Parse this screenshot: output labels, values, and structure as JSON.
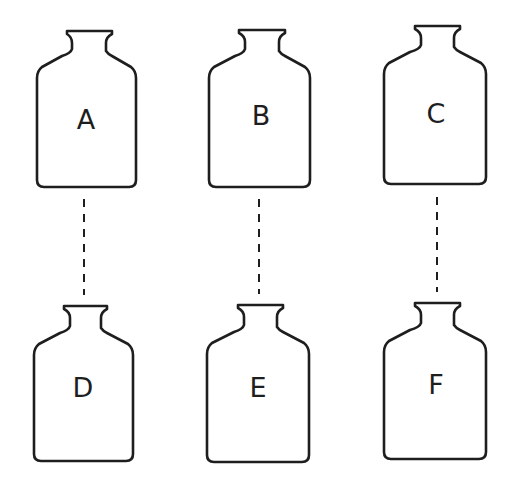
{
  "diagram": {
    "bottles": [
      {
        "id": "A",
        "label": "A",
        "row": "top",
        "col": 1
      },
      {
        "id": "B",
        "label": "B",
        "row": "top",
        "col": 2
      },
      {
        "id": "C",
        "label": "C",
        "row": "top",
        "col": 3
      },
      {
        "id": "D",
        "label": "D",
        "row": "bottom",
        "col": 1
      },
      {
        "id": "E",
        "label": "E",
        "row": "bottom",
        "col": 2
      },
      {
        "id": "F",
        "label": "F",
        "row": "bottom",
        "col": 3
      }
    ],
    "connections": [
      {
        "from": "A",
        "to": "D",
        "style": "dashed"
      },
      {
        "from": "B",
        "to": "E",
        "style": "dashed"
      },
      {
        "from": "C",
        "to": "F",
        "style": "dashed"
      }
    ],
    "colors": {
      "line": "#1e1e1e",
      "background": "#ffffff"
    }
  }
}
